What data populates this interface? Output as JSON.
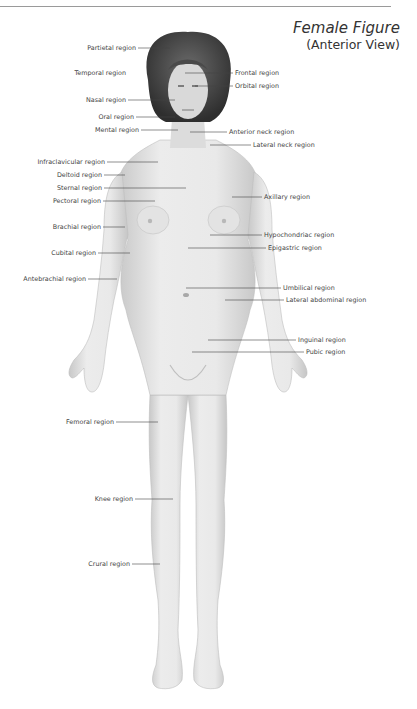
{
  "header": {
    "running_head": ""
  },
  "title": {
    "main": "Female Figure",
    "sub": "(Anterior View)"
  },
  "colors": {
    "line": "#444444",
    "skin": "#e6e6e6",
    "skin_shadow": "#c9c9c9",
    "hair": "#3a3a3a",
    "text": "#444444",
    "rule": "#9a9a9a"
  },
  "labels": [
    {
      "id": "partietal",
      "text": "Partietal region",
      "side": "left",
      "x": 138,
      "y": 48,
      "line_to": 170
    },
    {
      "id": "temporal",
      "text": "Temporal region",
      "side": "left",
      "x": 128,
      "y": 73,
      "line_to": 128
    },
    {
      "id": "frontal",
      "text": "Frontal region",
      "side": "right",
      "x": 233,
      "y": 73,
      "line_from": 185
    },
    {
      "id": "orbital",
      "text": "Orbital region",
      "side": "right",
      "x": 233,
      "y": 86,
      "line_from": 195
    },
    {
      "id": "nasal",
      "text": "Nasal region",
      "side": "left",
      "x": 128,
      "y": 100,
      "line_to": 175
    },
    {
      "id": "oral",
      "text": "Oral region",
      "side": "left",
      "x": 136,
      "y": 117,
      "line_to": 175
    },
    {
      "id": "mental",
      "text": "Mental region",
      "side": "left",
      "x": 141,
      "y": 130,
      "line_to": 178
    },
    {
      "id": "anterior-neck",
      "text": "Anterior neck region",
      "side": "right",
      "x": 227,
      "y": 132,
      "line_from": 190
    },
    {
      "id": "lateral-neck",
      "text": "Lateral neck region",
      "side": "right",
      "x": 251,
      "y": 145,
      "line_from": 210
    },
    {
      "id": "infraclavicular",
      "text": "Infraclavicular region",
      "side": "left",
      "x": 107,
      "y": 162,
      "line_to": 158
    },
    {
      "id": "deltoid",
      "text": "Deltoid region",
      "side": "left",
      "x": 104,
      "y": 175,
      "line_to": 125
    },
    {
      "id": "sternal",
      "text": "Sternal region",
      "side": "left",
      "x": 104,
      "y": 188,
      "line_to": 186
    },
    {
      "id": "pectoral",
      "text": "Pectoral region",
      "side": "left",
      "x": 103,
      "y": 201,
      "line_to": 155
    },
    {
      "id": "axillary",
      "text": "Axillary region",
      "side": "right",
      "x": 262,
      "y": 197,
      "line_from": 232
    },
    {
      "id": "brachial",
      "text": "Brachial region",
      "side": "left",
      "x": 103,
      "y": 227,
      "line_to": 125
    },
    {
      "id": "hypochondriac",
      "text": "Hypochondriac region",
      "side": "right",
      "x": 262,
      "y": 235,
      "line_from": 210
    },
    {
      "id": "epigastric",
      "text": "Epigastric region",
      "side": "right",
      "x": 266,
      "y": 248,
      "line_from": 188
    },
    {
      "id": "cubital",
      "text": "Cubital region",
      "side": "left",
      "x": 98,
      "y": 253,
      "line_to": 130
    },
    {
      "id": "antebrachial",
      "text": "Antebrachial region",
      "side": "left",
      "x": 88,
      "y": 279,
      "line_to": 117
    },
    {
      "id": "umbilical",
      "text": "Umbilical region",
      "side": "right",
      "x": 281,
      "y": 288,
      "line_from": 186
    },
    {
      "id": "lateral-abdominal",
      "text": "Lateral abdominal region",
      "side": "right",
      "x": 284,
      "y": 300,
      "line_from": 225
    },
    {
      "id": "inguinal",
      "text": "Inguinal region",
      "side": "right",
      "x": 296,
      "y": 340,
      "line_from": 208
    },
    {
      "id": "pubic",
      "text": "Pubic region",
      "side": "right",
      "x": 304,
      "y": 352,
      "line_from": 192
    },
    {
      "id": "femoral",
      "text": "Femoral region",
      "side": "left",
      "x": 116,
      "y": 422,
      "line_to": 158
    },
    {
      "id": "knee",
      "text": "Knee region",
      "side": "left",
      "x": 135,
      "y": 499,
      "line_to": 173
    },
    {
      "id": "crural",
      "text": "Crural region",
      "side": "left",
      "x": 132,
      "y": 564,
      "line_to": 160
    }
  ]
}
